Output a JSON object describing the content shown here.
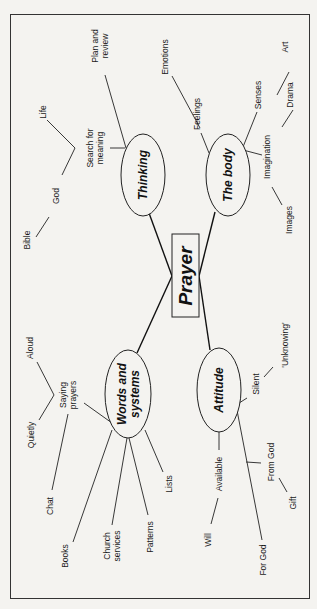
{
  "diagram": {
    "type": "mind-map",
    "orientation": "rotated-90-ccw",
    "colors": {
      "background": "#f4f3f0",
      "ink": "#1a1a1a"
    },
    "root": {
      "label": "Prayer"
    },
    "branches": {
      "thinking": {
        "label": "Thinking",
        "children": {
          "plan": "Plan and review",
          "plan_l1": "Plan and",
          "plan_l2": "review",
          "search": "Search for meaning",
          "search_l1": "Search for",
          "search_l2": "meaning",
          "life": "Life",
          "god": "God",
          "bible": "Bible"
        }
      },
      "body": {
        "label": "The body",
        "children": {
          "emotions": "Emotions",
          "feelings": "Feelings",
          "senses": "Senses",
          "art": "Art",
          "drama": "Drama",
          "imagination": "Imagination",
          "images": "Images"
        }
      },
      "words": {
        "label": "Words and systems",
        "label_l1": "Words and",
        "label_l2": "systems",
        "children": {
          "aloud": "Aloud",
          "saying": "Saying prayers",
          "saying_l1": "Saying",
          "saying_l2": "prayers",
          "quietly": "Quietly",
          "chat": "Chat",
          "books": "Books",
          "church": "Church services",
          "church_l1": "Church",
          "church_l2": "services",
          "patterns": "Patterns",
          "lists": "Lists"
        }
      },
      "attitude": {
        "label": "Attitude",
        "children": {
          "silent": "Silent",
          "unknowing": "'Unknowing'",
          "available": "Available",
          "will": "Will",
          "from_god": "From God",
          "gift": "Gift",
          "for_god": "For God"
        }
      }
    }
  }
}
